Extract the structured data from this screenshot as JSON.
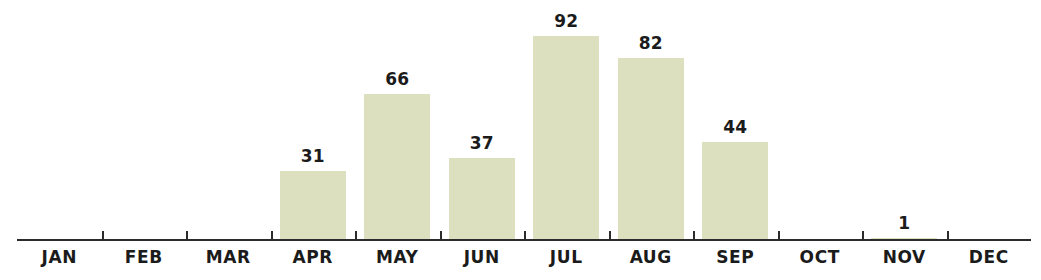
{
  "chart_data": {
    "type": "bar",
    "title": "",
    "subtitle": "",
    "xlabel": "",
    "ylabel": "",
    "categories": [
      "JAN",
      "FEB",
      "MAR",
      "APR",
      "MAY",
      "JUN",
      "JUL",
      "AUG",
      "SEP",
      "OCT",
      "NOV",
      "DEC"
    ],
    "values": [
      0,
      0,
      0,
      31,
      66,
      37,
      92,
      82,
      44,
      0,
      1,
      0
    ],
    "data_labels": [
      "",
      "",
      "",
      "31",
      "66",
      "37",
      "92",
      "82",
      "44",
      "",
      "1",
      ""
    ],
    "ylim": [
      0,
      92
    ],
    "grid": false,
    "legend": false,
    "legend_position": "none",
    "axis": {
      "y_axis_visible": false,
      "x_axis_visible": true,
      "tick_marks": "between-categories",
      "tick_count": 11
    },
    "colors": {
      "bar_fill": "#dde0bf",
      "axis": "#2b2b2b",
      "text": "#1b1b1b",
      "background": "#ffffff"
    }
  }
}
